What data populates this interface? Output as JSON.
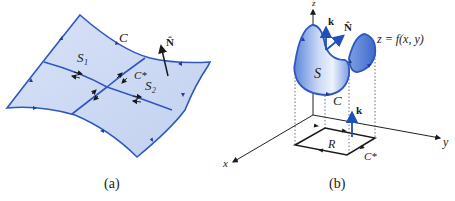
{
  "figure_a": {
    "caption": "(a)",
    "labels": {
      "curve": "C",
      "normal": "N̂",
      "surface1": "S₁",
      "surface2": "S₂",
      "interior_curve": "C*"
    }
  },
  "figure_b": {
    "caption": "(b)",
    "labels": {
      "z_axis": "z",
      "y_axis": "y",
      "x_axis": "x",
      "k_top": "k",
      "normal": "N̂",
      "equation": "z = f(x, y)",
      "surface": "S",
      "curve": "C",
      "k_bottom": "k",
      "region": "R",
      "projected_curve": "C*"
    }
  },
  "colors": {
    "surface_fill": "#c9d6f2",
    "surface_stroke": "#2f57c0",
    "surface_fill_dark": "#5b82d8",
    "axis": "#222222",
    "text": "#1a1a1a"
  }
}
